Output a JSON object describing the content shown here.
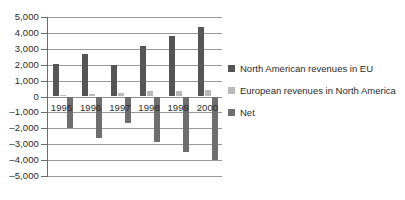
{
  "chart_data": {
    "type": "bar",
    "title": "",
    "subtitle": "",
    "xlabel": "",
    "ylabel": "",
    "categories": [
      "1995",
      "1996",
      "1997",
      "1998",
      "1999",
      "2000"
    ],
    "series": [
      {
        "name": "North American revenues in EU",
        "color": "#555555",
        "values": [
          2050,
          2650,
          1950,
          3200,
          3800,
          4400
        ]
      },
      {
        "name": "European revenues in North America",
        "color": "#b9b9b9",
        "values": [
          100,
          150,
          250,
          350,
          350,
          400
        ]
      },
      {
        "name": "Net",
        "color": "#6e6e6e",
        "values": [
          -2000,
          -2600,
          -1650,
          -2850,
          -3500,
          -4000
        ]
      }
    ],
    "ylim": [
      -5000,
      5000
    ],
    "ytick_values": [
      5000,
      4000,
      3000,
      2000,
      1000,
      0,
      -1000,
      -2000,
      -3000,
      -4000,
      -5000
    ],
    "ytick_labels": [
      "5,000",
      "4,000",
      "3,000",
      "2,000",
      "1,000",
      "0",
      "–1,000",
      "–2,000",
      "–3,000",
      "–4,000",
      "–5,000"
    ],
    "grid": true,
    "legend_position": "right"
  },
  "legend": {
    "items": [
      {
        "label": "North American revenues in EU",
        "swatch": "#555555"
      },
      {
        "label": "European revenues in North America",
        "swatch": "#b9b9b9"
      },
      {
        "label": "Net",
        "swatch": "#6e6e6e"
      }
    ]
  }
}
